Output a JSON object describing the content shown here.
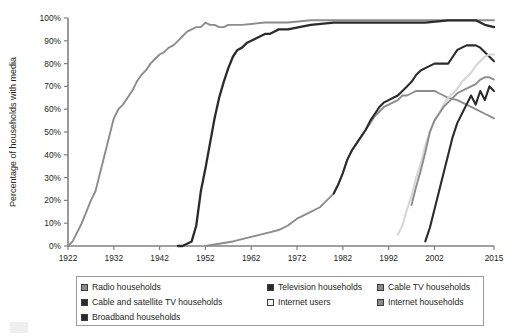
{
  "chart_data": {
    "type": "line",
    "title": "",
    "xlabel": "",
    "ylabel": "Percentage of households with media",
    "xlim": [
      1922,
      2015
    ],
    "ylim": [
      0,
      100
    ],
    "grid": false,
    "legend_position": "bottom",
    "x_tick_labels": [
      "1922",
      "1932",
      "1942",
      "1952",
      "1962",
      "1972",
      "1982",
      "1992",
      "2002",
      "2015"
    ],
    "x_tick_values": [
      1922,
      1932,
      1942,
      1952,
      1962,
      1972,
      1982,
      1992,
      2002,
      2015
    ],
    "y_tick_labels": [
      "0%",
      "10%",
      "20%",
      "30%",
      "40%",
      "50%",
      "60%",
      "70%",
      "80%",
      "90%",
      "100%"
    ],
    "y_tick_values": [
      0,
      10,
      20,
      30,
      40,
      50,
      60,
      70,
      80,
      90,
      100
    ],
    "series": [
      {
        "name": "Radio households",
        "color": "#8c8c8c",
        "width": 1.9,
        "points": [
          [
            1922,
            0
          ],
          [
            1923,
            2
          ],
          [
            1924,
            6
          ],
          [
            1925,
            10
          ],
          [
            1926,
            15
          ],
          [
            1927,
            20
          ],
          [
            1928,
            24
          ],
          [
            1929,
            32
          ],
          [
            1930,
            40
          ],
          [
            1931,
            48
          ],
          [
            1932,
            56
          ],
          [
            1933,
            60
          ],
          [
            1934,
            62
          ],
          [
            1935,
            65
          ],
          [
            1936,
            68
          ],
          [
            1937,
            72
          ],
          [
            1938,
            75
          ],
          [
            1939,
            77
          ],
          [
            1940,
            80
          ],
          [
            1941,
            82
          ],
          [
            1942,
            84
          ],
          [
            1943,
            85
          ],
          [
            1944,
            87
          ],
          [
            1945,
            88
          ],
          [
            1946,
            90
          ],
          [
            1947,
            92
          ],
          [
            1948,
            94
          ],
          [
            1949,
            95
          ],
          [
            1950,
            96
          ],
          [
            1951,
            96
          ],
          [
            1952,
            98
          ],
          [
            1953,
            97
          ],
          [
            1954,
            97
          ],
          [
            1955,
            96
          ],
          [
            1956,
            96
          ],
          [
            1957,
            97
          ],
          [
            1958,
            97
          ],
          [
            1959,
            97
          ],
          [
            1960,
            97
          ],
          [
            1965,
            98
          ],
          [
            1970,
            98
          ],
          [
            1975,
            99
          ],
          [
            1980,
            99
          ],
          [
            1985,
            99
          ],
          [
            1990,
            99
          ],
          [
            1995,
            99
          ],
          [
            2000,
            99
          ],
          [
            2005,
            99
          ],
          [
            2010,
            99
          ],
          [
            2013,
            99
          ],
          [
            2015,
            99
          ]
        ]
      },
      {
        "name": "Television households",
        "color": "#2b2b2b",
        "width": 2.3,
        "points": [
          [
            1946,
            0
          ],
          [
            1947,
            0
          ],
          [
            1948,
            1
          ],
          [
            1949,
            2
          ],
          [
            1950,
            9
          ],
          [
            1951,
            24
          ],
          [
            1952,
            34
          ],
          [
            1953,
            45
          ],
          [
            1954,
            56
          ],
          [
            1955,
            65
          ],
          [
            1956,
            72
          ],
          [
            1957,
            78
          ],
          [
            1958,
            83
          ],
          [
            1959,
            86
          ],
          [
            1960,
            87
          ],
          [
            1961,
            89
          ],
          [
            1962,
            90
          ],
          [
            1963,
            91
          ],
          [
            1964,
            92
          ],
          [
            1965,
            93
          ],
          [
            1966,
            93
          ],
          [
            1967,
            94
          ],
          [
            1968,
            95
          ],
          [
            1969,
            95
          ],
          [
            1970,
            95
          ],
          [
            1975,
            97
          ],
          [
            1980,
            98
          ],
          [
            1985,
            98
          ],
          [
            1990,
            98
          ],
          [
            1995,
            98
          ],
          [
            2000,
            98
          ],
          [
            2005,
            99
          ],
          [
            2009,
            99
          ],
          [
            2011,
            99
          ],
          [
            2012,
            98
          ],
          [
            2013,
            97
          ],
          [
            2015,
            96
          ]
        ]
      },
      {
        "name": "Cable TV households",
        "color": "#8c8c8c",
        "width": 1.9,
        "points": [
          [
            1952,
            0
          ],
          [
            1955,
            1
          ],
          [
            1958,
            2
          ],
          [
            1960,
            3
          ],
          [
            1962,
            4
          ],
          [
            1964,
            5
          ],
          [
            1966,
            6
          ],
          [
            1968,
            7
          ],
          [
            1970,
            9
          ],
          [
            1972,
            12
          ],
          [
            1974,
            14
          ],
          [
            1975,
            15
          ],
          [
            1976,
            16
          ],
          [
            1977,
            17
          ],
          [
            1978,
            19
          ],
          [
            1979,
            21
          ],
          [
            1980,
            23
          ],
          [
            1981,
            27
          ],
          [
            1982,
            32
          ],
          [
            1983,
            38
          ],
          [
            1984,
            42
          ],
          [
            1985,
            45
          ],
          [
            1986,
            48
          ],
          [
            1987,
            51
          ],
          [
            1988,
            54
          ],
          [
            1989,
            57
          ],
          [
            1990,
            59
          ],
          [
            1991,
            61
          ],
          [
            1992,
            62
          ],
          [
            1993,
            63
          ],
          [
            1994,
            64
          ],
          [
            1995,
            66
          ],
          [
            1996,
            66
          ],
          [
            1997,
            67
          ],
          [
            1998,
            68
          ],
          [
            1999,
            68
          ],
          [
            2000,
            68
          ],
          [
            2001,
            68
          ],
          [
            2002,
            68
          ],
          [
            2003,
            67
          ],
          [
            2004,
            66
          ],
          [
            2005,
            65
          ],
          [
            2007,
            64
          ],
          [
            2009,
            62
          ],
          [
            2011,
            60
          ],
          [
            2013,
            58
          ],
          [
            2015,
            56
          ]
        ]
      },
      {
        "name": "Cable and satellite TV households",
        "color": "#2b2b2b",
        "width": 2.1,
        "points": [
          [
            1980,
            23
          ],
          [
            1981,
            27
          ],
          [
            1982,
            32
          ],
          [
            1983,
            38
          ],
          [
            1984,
            42
          ],
          [
            1985,
            45
          ],
          [
            1986,
            48
          ],
          [
            1987,
            51
          ],
          [
            1988,
            55
          ],
          [
            1989,
            58
          ],
          [
            1990,
            61
          ],
          [
            1991,
            63
          ],
          [
            1992,
            64
          ],
          [
            1993,
            65
          ],
          [
            1994,
            66
          ],
          [
            1995,
            68
          ],
          [
            1996,
            70
          ],
          [
            1997,
            72
          ],
          [
            1998,
            75
          ],
          [
            1999,
            77
          ],
          [
            2000,
            78
          ],
          [
            2001,
            79
          ],
          [
            2002,
            80
          ],
          [
            2003,
            80
          ],
          [
            2004,
            80
          ],
          [
            2005,
            80
          ],
          [
            2006,
            83
          ],
          [
            2007,
            86
          ],
          [
            2008,
            87
          ],
          [
            2009,
            88
          ],
          [
            2010,
            88
          ],
          [
            2011,
            88
          ],
          [
            2012,
            87
          ],
          [
            2013,
            85
          ],
          [
            2014,
            83
          ],
          [
            2015,
            81
          ]
        ]
      },
      {
        "name": "Internet users",
        "color": "#d6d6d6",
        "width": 2.1,
        "points": [
          [
            1994,
            5
          ],
          [
            1995,
            9
          ],
          [
            1996,
            16
          ],
          [
            1997,
            22
          ],
          [
            1998,
            30
          ],
          [
            1999,
            36
          ],
          [
            2000,
            44
          ],
          [
            2001,
            50
          ],
          [
            2002,
            55
          ],
          [
            2003,
            58
          ],
          [
            2004,
            62
          ],
          [
            2005,
            65
          ],
          [
            2006,
            67
          ],
          [
            2007,
            69
          ],
          [
            2008,
            72
          ],
          [
            2009,
            74
          ],
          [
            2010,
            76
          ],
          [
            2011,
            79
          ],
          [
            2012,
            81
          ],
          [
            2013,
            83
          ],
          [
            2014,
            84
          ],
          [
            2015,
            84
          ]
        ]
      },
      {
        "name": "Internet households",
        "color": "#8c8c8c",
        "width": 1.9,
        "points": [
          [
            1997,
            18
          ],
          [
            1998,
            26
          ],
          [
            1999,
            33
          ],
          [
            2000,
            41
          ],
          [
            2001,
            50
          ],
          [
            2002,
            55
          ],
          [
            2003,
            58
          ],
          [
            2004,
            61
          ],
          [
            2005,
            63
          ],
          [
            2006,
            65
          ],
          [
            2007,
            67
          ],
          [
            2008,
            68
          ],
          [
            2009,
            69
          ],
          [
            2010,
            70
          ],
          [
            2011,
            71
          ],
          [
            2012,
            73
          ],
          [
            2013,
            74
          ],
          [
            2014,
            74
          ],
          [
            2015,
            73
          ]
        ]
      },
      {
        "name": "Broadband households",
        "color": "#2b2b2b",
        "width": 2.1,
        "points": [
          [
            2000,
            2
          ],
          [
            2001,
            8
          ],
          [
            2002,
            16
          ],
          [
            2003,
            24
          ],
          [
            2004,
            32
          ],
          [
            2005,
            40
          ],
          [
            2006,
            48
          ],
          [
            2007,
            54
          ],
          [
            2008,
            58
          ],
          [
            2009,
            62
          ],
          [
            2010,
            66
          ],
          [
            2011,
            62
          ],
          [
            2012,
            68
          ],
          [
            2013,
            64
          ],
          [
            2014,
            70
          ],
          [
            2015,
            68
          ]
        ]
      }
    ]
  },
  "legend": {
    "items": [
      {
        "label": "Radio households",
        "color": "#8c8c8c"
      },
      {
        "label": "Television households",
        "color": "#2b2b2b"
      },
      {
        "label": "Cable TV households",
        "color": "#8c8c8c"
      },
      {
        "label": "Cable and satellite TV households",
        "color": "#2b2b2b"
      },
      {
        "label": "Internet users",
        "color": "#f2f2f2"
      },
      {
        "label": "Internet households",
        "color": "#8c8c8c"
      },
      {
        "label": "Broadband households",
        "color": "#2b2b2b"
      }
    ]
  }
}
